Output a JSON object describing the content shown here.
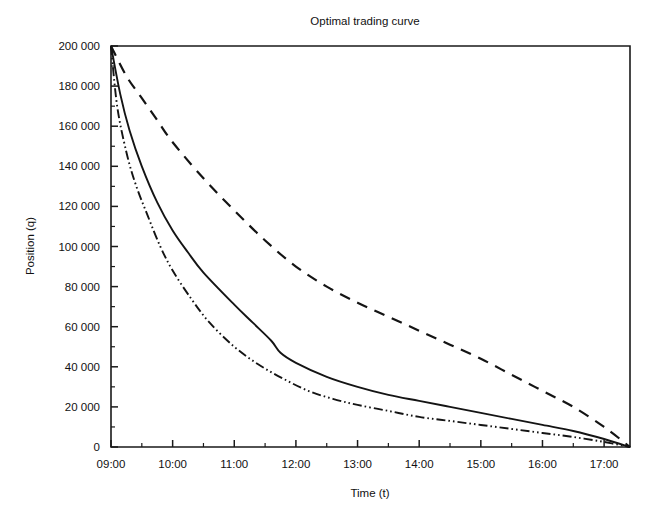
{
  "chart_data": {
    "type": "line",
    "title": "Optimal trading curve",
    "xlabel": "Time (t)",
    "ylabel": "Position (q)",
    "grid": false,
    "legend": "none",
    "xlim": [
      9.0,
      17.42
    ],
    "ylim": [
      0,
      200000
    ],
    "x_tick_labels": [
      "09:00",
      "10:00",
      "11:00",
      "12:00",
      "13:00",
      "14:00",
      "15:00",
      "16:00",
      "17:00"
    ],
    "x_tick_values": [
      9,
      10,
      11,
      12,
      13,
      14,
      15,
      16,
      17
    ],
    "x_minor_step": 0.5,
    "y_tick_labels": [
      "0",
      "20 000",
      "40 000",
      "60 000",
      "80 000",
      "100 000",
      "120 000",
      "140 000",
      "160 000",
      "180 000",
      "200 000"
    ],
    "y_tick_values": [
      0,
      20000,
      40000,
      60000,
      80000,
      100000,
      120000,
      140000,
      160000,
      180000,
      200000
    ],
    "y_minor_step": 10000,
    "series": [
      {
        "name": "slow-liquidation-curve",
        "style": "dashed",
        "color": "#141414",
        "x": [
          9.0,
          9.25,
          9.5,
          9.75,
          10.0,
          10.5,
          11.0,
          11.5,
          12.0,
          12.5,
          13.0,
          13.5,
          14.0,
          14.5,
          15.0,
          15.5,
          16.0,
          16.5,
          17.0,
          17.42
        ],
        "values": [
          200000,
          185000,
          174000,
          163000,
          152000,
          134000,
          118000,
          103000,
          90000,
          80000,
          72000,
          65000,
          58000,
          51000,
          44000,
          36000,
          28000,
          20000,
          10000,
          0
        ]
      },
      {
        "name": "intermediate-liquidation-curve",
        "style": "solid",
        "color": "#141414",
        "x": [
          9.0,
          9.15,
          9.3,
          9.5,
          9.75,
          10.0,
          10.25,
          10.5,
          11.0,
          11.3,
          11.6,
          11.75,
          12.0,
          12.5,
          13.0,
          13.5,
          14.0,
          14.5,
          15.0,
          15.5,
          16.0,
          16.5,
          17.0,
          17.42
        ],
        "values": [
          200000,
          176000,
          158000,
          140000,
          122000,
          108000,
          97000,
          87000,
          71000,
          62000,
          53000,
          47000,
          42000,
          35000,
          30000,
          26000,
          23000,
          20000,
          17000,
          14000,
          11000,
          8000,
          4000,
          0
        ]
      },
      {
        "name": "fast-liquidation-curve",
        "style": "dash-dot-dot",
        "color": "#141414",
        "x": [
          9.0,
          9.1,
          9.25,
          9.4,
          9.6,
          9.8,
          10.0,
          10.3,
          10.6,
          11.0,
          11.4,
          11.8,
          12.2,
          12.6,
          13.0,
          13.5,
          14.0,
          14.5,
          15.0,
          15.5,
          16.0,
          16.5,
          17.0,
          17.42
        ],
        "values": [
          200000,
          170000,
          147000,
          131000,
          115000,
          100000,
          88000,
          74000,
          62000,
          50000,
          41000,
          34000,
          28000,
          24000,
          21000,
          18000,
          15000,
          13000,
          11000,
          9000,
          7000,
          5000,
          2500,
          0
        ]
      }
    ]
  }
}
